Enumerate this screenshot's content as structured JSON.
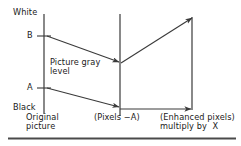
{
  "figure": {
    "type": "diagram",
    "labels": {
      "white": "White",
      "black": "Black",
      "tick_b": "B",
      "tick_a": "A",
      "picture_gray_level": "Picture gray\nlevel",
      "original_picture": "Original\npicture",
      "pixels_minus_a": "(Pixels −A)",
      "enhanced_pixels": "(Enhanced pixels)\nmultiply by  X"
    },
    "colors": {
      "line": "#3a3a3a",
      "text": "#1a1a1a",
      "rule": "#4a4a4a",
      "background": "#ffffff"
    },
    "geometry": {
      "axis_left_x": 44,
      "axis_left_top_y": 14,
      "axis_left_bottom_y": 114,
      "axis_mid_x": 120,
      "axis_mid_top_y": 14,
      "axis_mid_bottom_y": 116,
      "axis_right_x": 192,
      "axis_right_top_y": 17,
      "axis_right_bottom_y": 110,
      "tick_b_y": 36,
      "tick_a_y": 88,
      "mid_upper_node_y": 62,
      "mid_lower_node_y": 108,
      "baseline_y": 109,
      "bottom_rule_y": 138,
      "bottom_rule_x1": 8,
      "bottom_rule_x2": 236
    }
  }
}
